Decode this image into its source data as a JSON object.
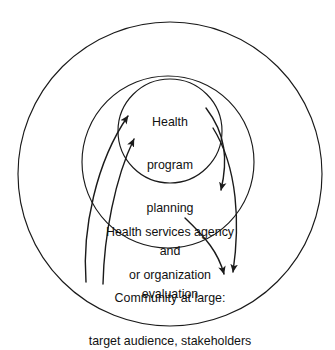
{
  "diagram": {
    "type": "concentric-circles",
    "background_color": "#ffffff",
    "stroke_color": "#1a1a1a",
    "text_color": "#111111",
    "levels": [
      {
        "id": "inner",
        "name": "health-program-planning-and-evaluation",
        "lines": [
          "Health",
          "program",
          "planning",
          "and",
          "evaluation"
        ],
        "text": "Health program planning and evaluation",
        "circle": {
          "cx": 170,
          "cy": 131,
          "r": 52
        }
      },
      {
        "id": "middle",
        "name": "health-services-agency-or-organization",
        "lines": [
          "Health services agency",
          "or organization"
        ],
        "text": "Health services agency or organization",
        "circle": {
          "cx": 168,
          "cy": 162,
          "r": 86
        }
      },
      {
        "id": "outer",
        "name": "community-at-large-target-audience-stakeholders",
        "lines": [
          "Community at large:",
          "target audience, stakeholders"
        ],
        "text": "Community at large: target audience, stakeholders",
        "circle": {
          "cx": 170,
          "cy": 174,
          "r": 152
        }
      }
    ],
    "arrows": [
      {
        "id": "arrow-community-to-program",
        "name": "arrow-community-to-program",
        "from": "outer",
        "to": "inner",
        "direction": "inward",
        "path": "M 86 282 C 82 230 96 162 128 116",
        "arrowhead_at": "end"
      },
      {
        "id": "arrow-agency-to-program",
        "name": "arrow-agency-to-program",
        "from": "middle",
        "to": "inner",
        "direction": "inward",
        "path": "M 103 284 C 104 236 115 178 134 139",
        "arrowhead_at": "end"
      },
      {
        "id": "arrow-program-to-agency",
        "name": "arrow-program-to-agency",
        "from": "inner",
        "to": "middle",
        "direction": "outward",
        "path": "M 206 108 C 226 134 228 160 221 190",
        "arrowhead_at": "end"
      },
      {
        "id": "arrow-program-to-community",
        "name": "arrow-program-to-community",
        "from": "inner",
        "to": "outer",
        "direction": "outward",
        "path": "M 213 128 C 238 168 240 224 233 272",
        "arrowhead_at": "end"
      },
      {
        "id": "arrow-agency-to-community",
        "name": "arrow-agency-to-community",
        "from": "middle",
        "to": "outer",
        "direction": "outward",
        "path": "M 185 218 C 206 238 218 252 224 274",
        "arrowhead_at": "end"
      }
    ]
  }
}
